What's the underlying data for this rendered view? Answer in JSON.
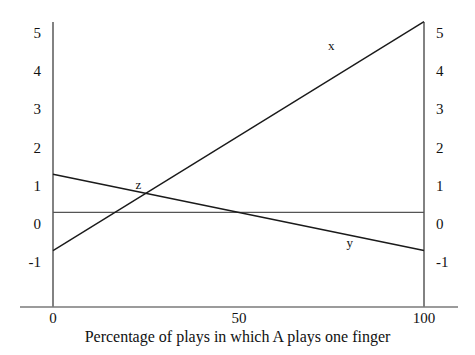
{
  "chart_data": {
    "type": "line",
    "title": "",
    "xlabel": "Percentage of plays in which A plays one finger",
    "ylabel": "",
    "xlim": [
      0,
      100
    ],
    "ylim": [
      -1.6,
      5.6
    ],
    "xticks": [
      0,
      50,
      100
    ],
    "xtick_labels": [
      "0",
      "50",
      "100"
    ],
    "yticks": [
      5,
      4,
      3,
      2,
      1,
      0,
      -1
    ],
    "ytick_labels": [
      "5",
      "4",
      "3",
      "2",
      "1",
      "0",
      "-1"
    ],
    "right_axis": true,
    "right_ytick_labels": [
      "5",
      "4",
      "3",
      "2",
      "1",
      "0",
      "-1"
    ],
    "grid": false,
    "legend": "inline-labels",
    "series": [
      {
        "name": "x",
        "label": "x",
        "label_x": 75,
        "label_y": 4.68,
        "x": [
          0,
          100
        ],
        "values": [
          -0.7,
          5.3
        ]
      },
      {
        "name": "y",
        "label": "y",
        "label_x": 80,
        "label_y": -0.48,
        "x": [
          0,
          100
        ],
        "values": [
          1.3,
          -0.7
        ]
      },
      {
        "name": "z",
        "label": "z",
        "label_x": 23,
        "label_y": 1.05,
        "x": [
          0,
          100
        ],
        "values": [
          0.3,
          0.3
        ]
      }
    ],
    "intersection_label": "z",
    "colors": {
      "line": "#1a1a1a",
      "axis": "#4d4d4d",
      "reference_line": "#555555",
      "background": "#ffffff"
    }
  },
  "axes": {
    "left": {
      "labels": [
        "5",
        "4",
        "3",
        "2",
        "1",
        "0",
        "-1"
      ]
    },
    "right": {
      "labels": [
        "5",
        "4",
        "3",
        "2",
        "1",
        "0",
        "-1"
      ]
    },
    "bottom": {
      "labels": [
        "0",
        "50",
        "100"
      ]
    }
  },
  "labels": {
    "x_curve": "x",
    "y_curve": "y",
    "z_point": "z",
    "xaxis_title": "Percentage of plays in which A plays one finger"
  }
}
